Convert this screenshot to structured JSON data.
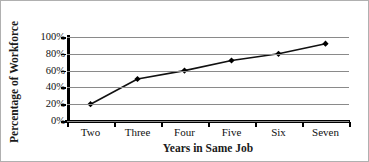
{
  "chart_data": {
    "type": "line",
    "title": "",
    "xlabel": "Years in Same Job",
    "ylabel": "Percentage of Workforce",
    "categories": [
      "Two",
      "Three",
      "Four",
      "Five",
      "Six",
      "Seven"
    ],
    "values": [
      20,
      50,
      60,
      72,
      80,
      92
    ],
    "series": [
      {
        "name": "Percentage of Workforce",
        "values": [
          20,
          50,
          60,
          72,
          80,
          92
        ]
      }
    ],
    "ylim": [
      0,
      100
    ],
    "ytick_labels": [
      "0%",
      "20%",
      "40%",
      "60%",
      "80%",
      "100%"
    ],
    "ytick_values": [
      0,
      20,
      40,
      60,
      80,
      100
    ],
    "grid": "horizontal",
    "legend": "none",
    "marker": "diamond",
    "colors": {
      "line": "#111111",
      "marker": "#000000",
      "gridline": "#8a8a8a",
      "axis": "#000000",
      "frame": "#b0b0b0",
      "text": "#111111"
    }
  }
}
